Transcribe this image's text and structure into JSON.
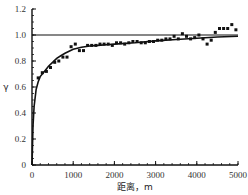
{
  "chart_data": {
    "type": "scatter",
    "title": "",
    "xlabel": "距离，m",
    "ylabel": "γ",
    "xlim": [
      0,
      5000
    ],
    "ylim": [
      0,
      1.2
    ],
    "xticks": [
      0,
      1000,
      2000,
      3000,
      4000,
      5000
    ],
    "xtick_labels": [
      "0",
      "1000",
      "2000",
      "3000",
      "4000",
      "5000"
    ],
    "yticks": [
      0,
      0.2,
      0.4,
      0.6,
      0.8,
      1.0,
      1.2
    ],
    "ytick_labels": [
      "0",
      "0.2",
      "0.4",
      "0.6",
      "0.8",
      "1.0",
      "1.2"
    ],
    "grid": false,
    "legend": null,
    "reference_line": {
      "name": "sill",
      "y": 1.0
    },
    "fitted_curve": {
      "name": "model",
      "x": [
        0,
        25,
        50,
        100,
        150,
        200,
        300,
        400,
        500,
        600,
        700,
        800,
        900,
        1000,
        1200,
        1400,
        1600,
        1800,
        2000,
        2500,
        3000,
        3500,
        4000,
        4500,
        5000
      ],
      "y": [
        0.0,
        0.3,
        0.45,
        0.58,
        0.64,
        0.68,
        0.72,
        0.76,
        0.79,
        0.82,
        0.84,
        0.86,
        0.875,
        0.89,
        0.905,
        0.915,
        0.92,
        0.925,
        0.93,
        0.94,
        0.955,
        0.965,
        0.975,
        0.985,
        0.99
      ]
    },
    "series": [
      {
        "name": "experimental",
        "x": [
          150,
          250,
          350,
          450,
          550,
          650,
          750,
          850,
          950,
          1050,
          1150,
          1250,
          1350,
          1450,
          1550,
          1650,
          1750,
          1850,
          1950,
          2050,
          2150,
          2250,
          2350,
          2450,
          2550,
          2650,
          2750,
          2850,
          2950,
          3050,
          3150,
          3250,
          3350,
          3450,
          3550,
          3650,
          3750,
          3850,
          3950,
          4050,
          4150,
          4250,
          4350,
          4450,
          4550,
          4650,
          4750,
          4850,
          4950
        ],
        "y": [
          0.67,
          0.71,
          0.72,
          0.75,
          0.79,
          0.8,
          0.83,
          0.83,
          0.91,
          0.93,
          0.88,
          0.88,
          0.92,
          0.92,
          0.92,
          0.93,
          0.93,
          0.93,
          0.92,
          0.94,
          0.94,
          0.93,
          0.94,
          0.95,
          0.95,
          0.94,
          0.94,
          0.95,
          0.95,
          0.96,
          0.96,
          0.97,
          0.97,
          0.99,
          0.97,
          1.01,
          0.99,
          0.97,
          0.98,
          1.0,
          0.97,
          0.93,
          0.96,
          1.02,
          1.05,
          1.05,
          1.05,
          1.08,
          1.04
        ]
      }
    ]
  }
}
